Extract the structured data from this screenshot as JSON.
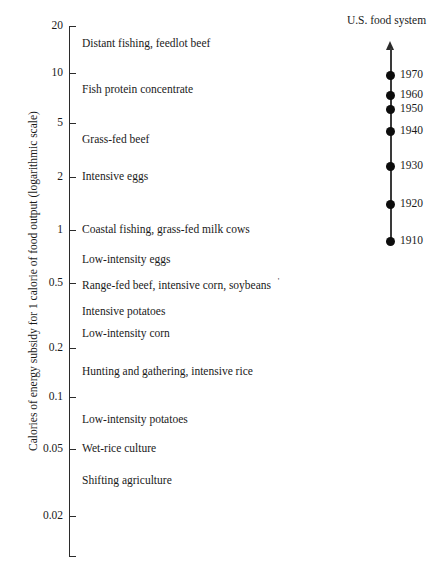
{
  "chart_data": {
    "type": "scatter",
    "title": "",
    "ylabel": "Calories of energy subsidy for 1 calorie of food output (logarithmic scale)",
    "xlabel": "",
    "scale": "log",
    "ylim": [
      0.02,
      20
    ],
    "grid": false,
    "legend": null,
    "y_ticks": [
      {
        "value": 20,
        "label": "20"
      },
      {
        "value": 10,
        "label": "10"
      },
      {
        "value": 5,
        "label": "5"
      },
      {
        "value": 2,
        "label": "2"
      },
      {
        "value": 1,
        "label": "1"
      },
      {
        "value": 0.5,
        "label": "0.5"
      },
      {
        "value": 0.2,
        "label": "0.2"
      },
      {
        "value": 0.1,
        "label": "0.1"
      },
      {
        "value": 0.05,
        "label": "0.05"
      },
      {
        "value": 0.02,
        "label": "0.02"
      }
    ],
    "categories": [
      "Distant fishing, feedlot beef",
      "Fish protein concentrate",
      "Grass-fed beef",
      "Intensive eggs",
      "Coastal fishing, grass-fed milk cows",
      "Low-intensity eggs",
      "Range-fed beef, intensive corn, soybeans",
      "Intensive potatoes",
      "Low-intensity corn",
      "Hunting and gathering, intensive rice",
      "Low-intensity potatoes",
      "Wet-rice culture",
      "Shifting agriculture"
    ],
    "values": [
      14,
      7.5,
      3.6,
      2.0,
      1.0,
      0.72,
      0.5,
      0.36,
      0.26,
      0.155,
      0.072,
      0.05,
      0.033
    ]
  },
  "axis": {
    "title": "Calories of energy subsidy for 1 calorie of food output (logarithmic scale)"
  },
  "ticks": [
    {
      "label": "20",
      "y": 26
    },
    {
      "label": "10",
      "y": 73
    },
    {
      "label": "5",
      "y": 123
    },
    {
      "label": "2",
      "y": 177
    },
    {
      "label": "1",
      "y": 230
    },
    {
      "label": "0.5",
      "y": 283
    },
    {
      "label": "0.2",
      "y": 348
    },
    {
      "label": "0.1",
      "y": 397
    },
    {
      "label": "0.05",
      "y": 449
    },
    {
      "label": "0.02",
      "y": 516
    }
  ],
  "points": [
    {
      "label": "Distant fishing, feedlot beef",
      "y": 44,
      "stray": ""
    },
    {
      "label": "Fish protein concentrate",
      "y": 90,
      "stray": ""
    },
    {
      "label": "Grass-fed beef",
      "y": 140,
      "stray": ""
    },
    {
      "label": "Intensive eggs",
      "y": 177,
      "stray": ""
    },
    {
      "label": "Coastal fishing, grass-fed milk cows",
      "y": 230,
      "stray": ""
    },
    {
      "label": "Low-intensity eggs",
      "y": 260,
      "stray": ""
    },
    {
      "label": "Range-fed beef, intensive corn, soybeans",
      "y": 283,
      "stray": "'"
    },
    {
      "label": "Intensive potatoes",
      "y": 312,
      "stray": ""
    },
    {
      "label": "Low-intensity corn",
      "y": 334,
      "stray": ""
    },
    {
      "label": "Hunting and gathering, intensive rice",
      "y": 372,
      "stray": ""
    },
    {
      "label": "Low-intensity potatoes",
      "y": 420,
      "stray": ""
    },
    {
      "label": "Wet-rice culture",
      "y": 449,
      "stray": ""
    },
    {
      "label": "Shifting agriculture",
      "y": 481,
      "stray": ""
    }
  ],
  "timeline": {
    "title": "U.S. food system",
    "entries": [
      {
        "label": "1970",
        "y": 75
      },
      {
        "label": "1960",
        "y": 95
      },
      {
        "label": "1950",
        "y": 109
      },
      {
        "label": "1940",
        "y": 131
      },
      {
        "label": "1930",
        "y": 166
      },
      {
        "label": "1920",
        "y": 204
      },
      {
        "label": "1910",
        "y": 241
      }
    ]
  }
}
